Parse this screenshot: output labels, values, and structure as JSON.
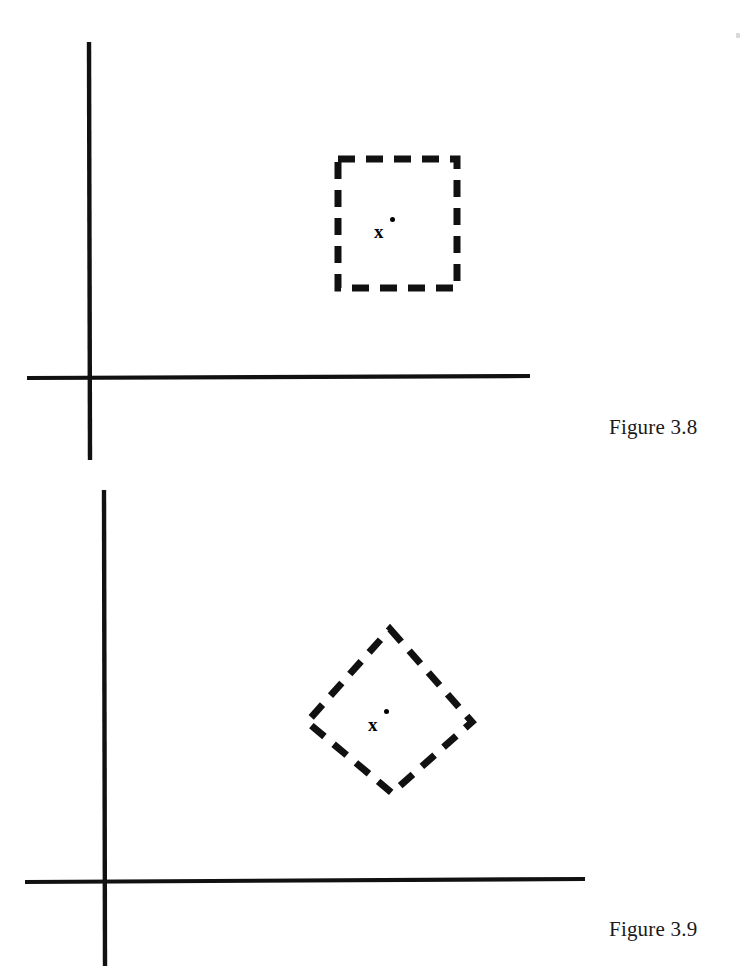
{
  "page": {
    "background_color": "#ffffff",
    "ink_color": "#111111",
    "width": 752,
    "height": 971
  },
  "figures": [
    {
      "id": "figure-3-8",
      "caption": "Figure 3.8",
      "caption_x": 609,
      "caption_y": 415,
      "shape_kind": "dashed-square",
      "shape_note": "axis-aligned dashed square (ball in the max / sup norm)",
      "point_label": "x",
      "point_marker": "dot",
      "point_x": 381,
      "point_y": 231,
      "axes": {
        "origin_x": 89,
        "origin_y": 377,
        "vertical_top": 42,
        "vertical_bottom": 460,
        "horizontal_left": 27,
        "horizontal_right": 530,
        "line_width": 4
      },
      "shape": {
        "left": 338,
        "top": 159,
        "right": 457,
        "bottom": 288,
        "dash_on": 16,
        "dash_off": 11,
        "stroke_width": 7
      }
    },
    {
      "id": "figure-3-9",
      "caption": "Figure 3.9",
      "caption_x": 609,
      "caption_y": 917,
      "shape_kind": "dashed-diamond",
      "shape_note": "dashed square rotated 45 degrees (ball in the taxicab / l1 norm)",
      "point_label": "x",
      "point_marker": "dot",
      "point_x": 375,
      "point_y": 724,
      "axes": {
        "origin_x": 104,
        "origin_y": 881,
        "vertical_top": 490,
        "vertical_bottom": 966,
        "horizontal_left": 25,
        "horizontal_right": 585,
        "line_width": 4
      },
      "shape": {
        "center_x": 390,
        "center_y": 711,
        "vertex_top_x": 390,
        "vertex_top_y": 629,
        "vertex_right_x": 472,
        "vertex_right_y": 722,
        "vertex_bottom_x": 392,
        "vertex_bottom_y": 793,
        "vertex_left_x": 307,
        "vertex_left_y": 722,
        "dash_on": 16,
        "dash_off": 12,
        "stroke_width": 7
      }
    }
  ],
  "artifacts": {
    "scan_speck_x": 736,
    "scan_speck_y": 33
  }
}
